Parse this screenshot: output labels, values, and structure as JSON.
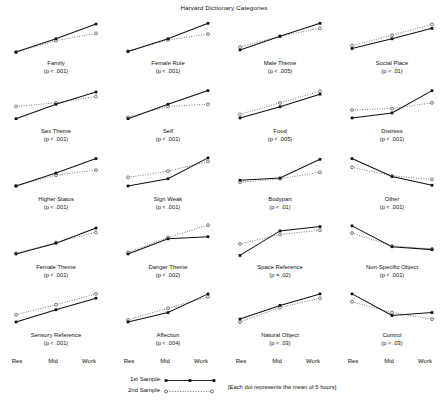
{
  "chart_data": {
    "type": "line",
    "title": "Harvard Dictionary Categories",
    "xlabel": "",
    "ylabel": "",
    "grid": false,
    "legend_position": "bottom-center",
    "categories": [
      "Res",
      "Mid",
      "Work"
    ],
    "ylim": [
      0,
      1
    ],
    "footnote": "[Each dot represents the mean of 5 hours]",
    "series_styles": [
      {
        "name": "1st Sample",
        "line": "solid",
        "marker": "filled-square",
        "color": "#111111"
      },
      {
        "name": "2nd Sample",
        "line": "dotted",
        "marker": "open-circle",
        "color": "#555555"
      }
    ],
    "panels": [
      {
        "label": "Family",
        "pvalue": "(p < .001)",
        "series": [
          {
            "name": "1st Sample",
            "values": [
              0.08,
              0.45,
              0.86
            ]
          },
          {
            "name": "2nd Sample",
            "values": [
              0.08,
              0.4,
              0.6
            ]
          }
        ]
      },
      {
        "label": "Female Role",
        "pvalue": "(p < .001)",
        "series": [
          {
            "name": "1st Sample",
            "values": [
              0.1,
              0.45,
              0.88
            ]
          },
          {
            "name": "2nd Sample",
            "values": [
              0.1,
              0.42,
              0.58
            ]
          }
        ]
      },
      {
        "label": "Male Theme",
        "pvalue": "(p < .005)",
        "series": [
          {
            "name": "1st Sample",
            "values": [
              0.14,
              0.52,
              0.88
            ]
          },
          {
            "name": "2nd Sample",
            "values": [
              0.22,
              0.52,
              0.74
            ]
          }
        ]
      },
      {
        "label": "Social Place",
        "pvalue": "(p < .01)",
        "series": [
          {
            "name": "1st Sample",
            "values": [
              0.18,
              0.45,
              0.74
            ]
          },
          {
            "name": "2nd Sample",
            "values": [
              0.26,
              0.55,
              0.85
            ]
          }
        ]
      },
      {
        "label": "Sex Theme",
        "pvalue": "(p < .001)",
        "series": [
          {
            "name": "1st Sample",
            "values": [
              0.12,
              0.52,
              0.86
            ]
          },
          {
            "name": "2nd Sample",
            "values": [
              0.46,
              0.56,
              0.74
            ]
          }
        ]
      },
      {
        "label": "Self",
        "pvalue": "(p < .001)",
        "series": [
          {
            "name": "1st Sample",
            "values": [
              0.12,
              0.52,
              0.9
            ]
          },
          {
            "name": "2nd Sample",
            "values": [
              0.16,
              0.46,
              0.52
            ]
          }
        ]
      },
      {
        "label": "Food",
        "pvalue": "(p < .005)",
        "series": [
          {
            "name": "1st Sample",
            "values": [
              0.14,
              0.45,
              0.8
            ]
          },
          {
            "name": "2nd Sample",
            "values": [
              0.24,
              0.56,
              0.88
            ]
          }
        ]
      },
      {
        "label": "Distress",
        "pvalue": "(p < .001)",
        "series": [
          {
            "name": "1st Sample",
            "values": [
              0.14,
              0.28,
              0.9
            ]
          },
          {
            "name": "2nd Sample",
            "values": [
              0.36,
              0.4,
              0.56
            ]
          }
        ]
      },
      {
        "label": "Higher Status",
        "pvalue": "(p < .001)",
        "series": [
          {
            "name": "1st Sample",
            "values": [
              0.14,
              0.5,
              0.9
            ]
          },
          {
            "name": "2nd Sample",
            "values": [
              0.14,
              0.44,
              0.58
            ]
          }
        ]
      },
      {
        "label": "Sign Weak",
        "pvalue": "(p < .001)",
        "series": [
          {
            "name": "1st Sample",
            "values": [
              0.14,
              0.34,
              0.92
            ]
          },
          {
            "name": "2nd Sample",
            "values": [
              0.38,
              0.55,
              0.82
            ]
          }
        ]
      },
      {
        "label": "Bodypart",
        "pvalue": "(p < .01)",
        "series": [
          {
            "name": "1st Sample",
            "values": [
              0.3,
              0.36,
              0.88
            ]
          },
          {
            "name": "2nd Sample",
            "values": [
              0.24,
              0.34,
              0.52
            ]
          }
        ]
      },
      {
        "label": "Other",
        "pvalue": "(p < .001)",
        "series": [
          {
            "name": "1st Sample",
            "values": [
              0.9,
              0.4,
              0.16
            ]
          },
          {
            "name": "2nd Sample",
            "values": [
              0.66,
              0.42,
              0.32
            ]
          }
        ]
      },
      {
        "label": "Female Theme",
        "pvalue": "(p < .001)",
        "series": [
          {
            "name": "1st Sample",
            "values": [
              0.14,
              0.44,
              0.86
            ]
          },
          {
            "name": "2nd Sample",
            "values": [
              0.16,
              0.46,
              0.74
            ]
          }
        ]
      },
      {
        "label": "Danger Theme",
        "pvalue": "(p < .002)",
        "series": [
          {
            "name": "1st Sample",
            "values": [
              0.14,
              0.56,
              0.62
            ]
          },
          {
            "name": "2nd Sample",
            "values": [
              0.18,
              0.6,
              0.94
            ]
          }
        ]
      },
      {
        "label": "Space Reference",
        "pvalue": "(p = .02)",
        "series": [
          {
            "name": "1st Sample",
            "values": [
              0.1,
              0.78,
              0.9
            ]
          },
          {
            "name": "2nd Sample",
            "values": [
              0.42,
              0.68,
              0.8
            ]
          }
        ]
      },
      {
        "label": "Non-Specific Object",
        "pvalue": "(p < .001)",
        "series": [
          {
            "name": "1st Sample",
            "values": [
              0.92,
              0.34,
              0.26
            ]
          },
          {
            "name": "2nd Sample",
            "values": [
              0.72,
              0.36,
              0.28
            ]
          }
        ]
      },
      {
        "label": "Sensory Reference",
        "pvalue": "(p < .001)",
        "series": [
          {
            "name": "1st Sample",
            "values": [
              0.14,
              0.48,
              0.8
            ]
          },
          {
            "name": "2nd Sample",
            "values": [
              0.34,
              0.62,
              0.92
            ]
          }
        ]
      },
      {
        "label": "Affection",
        "pvalue": "(p < .004)",
        "series": [
          {
            "name": "1st Sample",
            "values": [
              0.14,
              0.4,
              0.92
            ]
          },
          {
            "name": "2nd Sample",
            "values": [
              0.2,
              0.52,
              0.84
            ]
          }
        ]
      },
      {
        "label": "Natural Object",
        "pvalue": "(p < .03)",
        "series": [
          {
            "name": "1st Sample",
            "values": [
              0.22,
              0.6,
              0.92
            ]
          },
          {
            "name": "2nd Sample",
            "values": [
              0.14,
              0.54,
              0.8
            ]
          }
        ]
      },
      {
        "label": "Control",
        "pvalue": "(p < .03)",
        "series": [
          {
            "name": "1st Sample",
            "values": [
              0.92,
              0.32,
              0.4
            ]
          },
          {
            "name": "2nd Sample",
            "values": [
              0.7,
              0.4,
              0.22
            ]
          }
        ]
      }
    ]
  },
  "axis_groups": [
    {
      "ticks": [
        "Res",
        "Mid",
        "Work"
      ]
    },
    {
      "ticks": [
        "Res",
        "Mid",
        "Work"
      ]
    },
    {
      "ticks": [
        "Res",
        "Mid",
        "Work"
      ]
    },
    {
      "ticks": [
        "Res",
        "Mid",
        "Work"
      ]
    }
  ],
  "legend": {
    "first_label": "1st Sample",
    "second_label": "2nd Sample"
  },
  "footnote": "[Each dot represents the mean of 5 hours]"
}
